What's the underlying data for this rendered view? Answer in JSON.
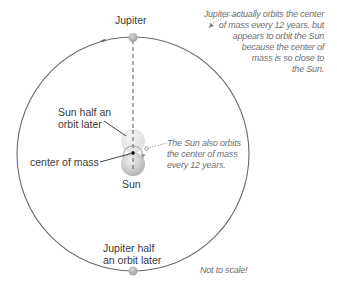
{
  "labels": {
    "jupiter": "Jupiter",
    "sun_half_orbit": [
      "Sun half an",
      "orbit later"
    ],
    "center_of_mass": "center of mass",
    "sun": "Sun",
    "jupiter_half_orbit": [
      "Jupiter half",
      "an orbit later"
    ]
  },
  "notes": {
    "jupiter_orbit": [
      "Jupiter actually orbits the center",
      "of mass every 12 years, but",
      "appears to orbit the Sun",
      "because the center of",
      "mass is so close to",
      "the Sun."
    ],
    "sun_orbit": [
      "The Sun also orbits",
      "the center of mass",
      "every 12 years."
    ],
    "scale": "Not to scale!"
  },
  "colors": {
    "orbit": "#6b6b6b",
    "planet": "#b8b8b8",
    "sun": "#c8c8c8",
    "annotation": "#707070"
  }
}
